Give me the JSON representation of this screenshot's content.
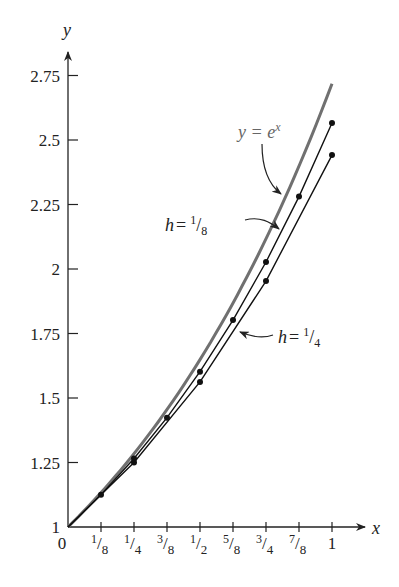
{
  "chart_data": {
    "type": "line",
    "title": "",
    "xlabel": "x",
    "ylabel": "y",
    "xlim": [
      0,
      1
    ],
    "ylim": [
      1,
      2.75
    ],
    "grid": false,
    "x_ticks": [
      {
        "value": 0,
        "label": "0"
      },
      {
        "value": 0.125,
        "num": "1",
        "den": "8"
      },
      {
        "value": 0.25,
        "num": "1",
        "den": "4"
      },
      {
        "value": 0.375,
        "num": "3",
        "den": "8"
      },
      {
        "value": 0.5,
        "num": "1",
        "den": "2"
      },
      {
        "value": 0.625,
        "num": "5",
        "den": "8"
      },
      {
        "value": 0.75,
        "num": "3",
        "den": "4"
      },
      {
        "value": 0.875,
        "num": "7",
        "den": "8"
      },
      {
        "value": 1,
        "label": "1"
      }
    ],
    "y_ticks": [
      {
        "value": 1,
        "label": "1"
      },
      {
        "value": 1.25,
        "label": "1.25"
      },
      {
        "value": 1.5,
        "label": "1.5"
      },
      {
        "value": 1.75,
        "label": "1.75"
      },
      {
        "value": 2,
        "label": "2"
      },
      {
        "value": 2.25,
        "label": "2.25"
      },
      {
        "value": 2.5,
        "label": "2.5"
      },
      {
        "value": 2.75,
        "label": "2.75"
      }
    ],
    "series": [
      {
        "name": "y = e^x",
        "kind": "exact",
        "color": "#707070",
        "x": [
          0,
          0.125,
          0.25,
          0.375,
          0.5,
          0.625,
          0.75,
          0.875,
          1
        ],
        "y": [
          1,
          1.1331,
          1.284,
          1.455,
          1.6487,
          1.8682,
          2.117,
          2.3989,
          2.7183
        ]
      },
      {
        "name": "h = 1/8",
        "kind": "euler",
        "color": "#111111",
        "x": [
          0,
          0.125,
          0.25,
          0.375,
          0.5,
          0.625,
          0.75,
          0.875,
          1
        ],
        "y": [
          1,
          1.125,
          1.2656,
          1.4238,
          1.6018,
          1.802,
          2.0273,
          2.2807,
          2.5658
        ]
      },
      {
        "name": "h = 1/4",
        "kind": "euler",
        "color": "#111111",
        "x": [
          0,
          0.25,
          0.5,
          0.75,
          1
        ],
        "y": [
          1,
          1.25,
          1.5625,
          1.9531,
          2.4414
        ]
      }
    ],
    "annotations": [
      {
        "text_main": "y = e",
        "text_sup": "x",
        "points_to": "y = e^x"
      },
      {
        "text_main": "h = ",
        "num": "1",
        "den": "8",
        "points_to": "h = 1/8"
      },
      {
        "text_main": "h = ",
        "num": "1",
        "den": "4",
        "points_to": "h = 1/4"
      }
    ]
  }
}
